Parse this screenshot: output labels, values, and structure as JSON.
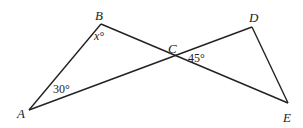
{
  "diagram": {
    "points": {
      "A": {
        "label": "A",
        "x": 29,
        "y": 110
      },
      "B": {
        "label": "B",
        "x": 101,
        "y": 24
      },
      "C": {
        "label": "C",
        "x": 174,
        "y": 56
      },
      "D": {
        "label": "D",
        "x": 252,
        "y": 27
      },
      "E": {
        "label": "E",
        "x": 288,
        "y": 103
      }
    },
    "segments": [
      "AB",
      "BE",
      "AD",
      "DE"
    ],
    "angles": {
      "B": {
        "label": "x°"
      },
      "A": {
        "label": "30°"
      },
      "C": {
        "label": "45°"
      }
    },
    "line_color": "#222222"
  }
}
